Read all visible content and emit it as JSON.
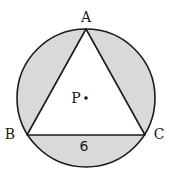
{
  "diagram": {
    "type": "geometry",
    "colors": {
      "shade": "#d9d9d9",
      "stroke": "#1a1a1a",
      "triangle_fill": "#ffffff"
    },
    "circle": {
      "cx": 86,
      "cy": 98,
      "r": 69
    },
    "points": {
      "A": {
        "x": 86,
        "y": 29
      },
      "B": {
        "x": 27,
        "y": 135
      },
      "C": {
        "x": 145,
        "y": 135
      },
      "P": {
        "x": 86,
        "y": 98
      }
    },
    "labels": {
      "A": "A",
      "B": "B",
      "C": "C",
      "P": "P",
      "side_BC": "6"
    }
  }
}
